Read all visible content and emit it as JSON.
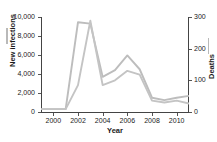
{
  "chart_data": {
    "type": "line",
    "title": "",
    "xlabel": "Year",
    "ylabel": "New infections",
    "y2label": "Deaths",
    "grid": false,
    "legend_position": "axis-labels",
    "xlim": [
      1999,
      2011
    ],
    "ylim": [
      0,
      10000
    ],
    "y2lim": [
      0,
      300
    ],
    "x": [
      1999,
      2000,
      2001,
      2002,
      2003,
      2004,
      2005,
      2006,
      2007,
      2008,
      2009,
      2010,
      2011
    ],
    "x_ticks": [
      2000,
      2002,
      2004,
      2006,
      2008,
      2010
    ],
    "x_tick_labels": [
      "2000",
      "2002",
      "2004",
      "2006",
      "2008",
      "2010"
    ],
    "y_ticks": [
      0,
      2000,
      4000,
      6000,
      8000,
      10000
    ],
    "y_tick_labels": [
      "0",
      "2,000",
      "4,000",
      "6,000",
      "8,000",
      "10,000"
    ],
    "y2_ticks": [
      0,
      100,
      200,
      300
    ],
    "y2_tick_labels": [
      "0",
      "100",
      "200",
      "300"
    ],
    "series": [
      {
        "name": "New infections",
        "axis": "left",
        "color": "#bdbdbd",
        "values": [
          300,
          300,
          300,
          9450,
          9300,
          3700,
          4400,
          5950,
          4500,
          1500,
          1250,
          1500,
          1700
        ]
      },
      {
        "name": "Deaths",
        "axis": "right",
        "color": "#c4c4c4",
        "values": [
          9,
          9,
          9,
          85,
          288,
          85,
          100,
          130,
          118,
          36,
          30,
          36,
          27
        ]
      }
    ]
  },
  "axes": {
    "left": {
      "title": "New infections",
      "legend_swatch": "line-swatch-icon"
    },
    "right": {
      "title": "Deaths",
      "legend_swatch": "line-swatch-icon"
    },
    "bottom": {
      "title": "Year"
    }
  },
  "colors": {
    "background": "#ffffff",
    "axis": "#444444",
    "text": "#1a1a1a",
    "series_infections": "#bdbdbd",
    "series_deaths": "#c4c4c4"
  }
}
